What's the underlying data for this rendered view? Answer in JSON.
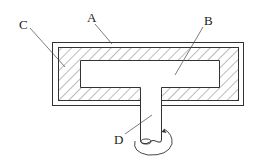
{
  "diagram": {
    "labels": {
      "A": "A",
      "B": "B",
      "C": "C",
      "D": "D"
    },
    "colors": {
      "stroke": "#333333",
      "hatch": "#555555",
      "background": "#ffffff"
    }
  }
}
